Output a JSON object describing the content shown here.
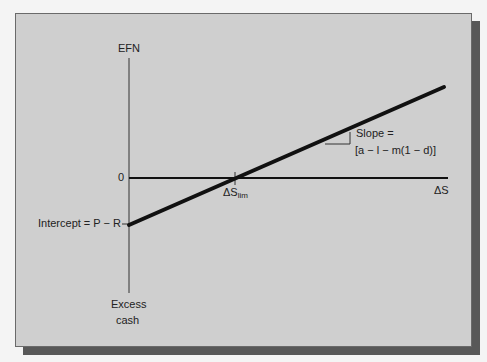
{
  "diagram": {
    "y_axis_top_label": "EFN",
    "y_axis_bottom_label_line1": "Excess",
    "y_axis_bottom_label_line2": "cash",
    "zero_label": "0",
    "x_axis_label": "ΔS",
    "threshold_label_main": "ΔS",
    "threshold_label_sub": "lim",
    "intercept_label": "Intercept = P − R",
    "slope_label_line1": "Slope =",
    "slope_label_line2": "[a − l − m(1 − d)]"
  },
  "colors": {
    "panel": "#cfcfcf",
    "shadow": "#585858",
    "line": "#111111"
  }
}
